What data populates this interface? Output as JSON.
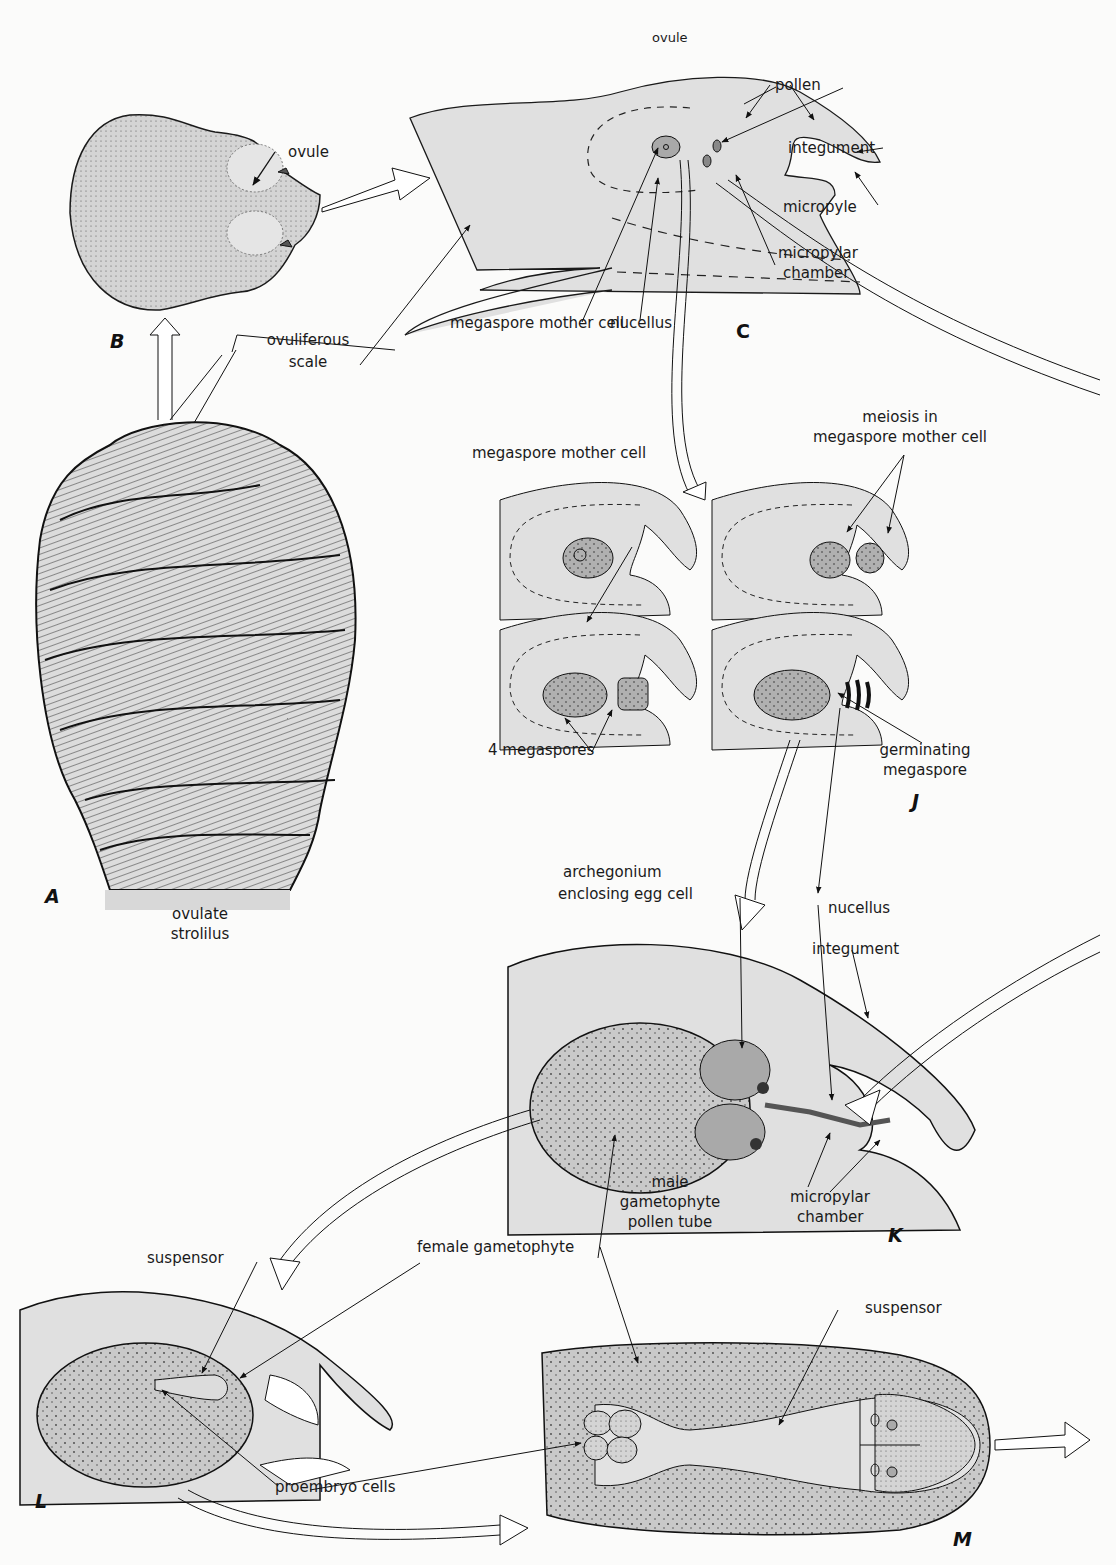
{
  "figure": {
    "colors": {
      "background": "#fbfbfa",
      "tissue_light": "#e2e2e2",
      "tissue_medium": "#c9c9c9",
      "tissue_dark": "#a9a9a9",
      "outline": "#1a1a1a"
    }
  },
  "panels": {
    "A": {
      "letter": "A",
      "caption_line1": "ovulate",
      "caption_line2": "strolilus"
    },
    "B": {
      "letter": "B",
      "labels": {
        "ovule": "ovule",
        "scale_line1": "ovuliferous",
        "scale_line2": "scale"
      }
    },
    "C": {
      "letter": "C",
      "labels": {
        "ovule": "ovule",
        "pollen": "pollen",
        "integument": "integument",
        "micropyle": "micropyle",
        "micropylar_chamber_line1": "micropylar",
        "micropylar_chamber_line2": "chamber",
        "megaspore_mother_cell": "megaspore mother cell",
        "nucellus": "nucellus"
      }
    },
    "J": {
      "letter": "J",
      "labels": {
        "megaspore_mother_cell": "megaspore mother cell",
        "meiosis_line1": "meiosis in",
        "meiosis_line2": "megaspore mother cell",
        "four_megaspores": "4 megaspores",
        "germinating_line1": "germinating",
        "germinating_line2": "megaspore"
      }
    },
    "K": {
      "letter": "K",
      "labels": {
        "archegonium_line1": "archegonium",
        "archegonium_line2": "enclosing egg cell",
        "nucellus": "nucellus",
        "integument": "integument",
        "male_line1": "male",
        "male_line2": "gametophyte",
        "male_line3": "pollen tube",
        "micropylar_line1": "micropylar",
        "micropylar_line2": "chamber"
      }
    },
    "L": {
      "letter": "L",
      "labels": {
        "suspensor": "suspensor",
        "female_gametophyte": "female gametophyte",
        "proembryo_cells": "proembryo cells"
      }
    },
    "M": {
      "letter": "M",
      "labels": {
        "suspensor": "suspensor"
      }
    }
  }
}
